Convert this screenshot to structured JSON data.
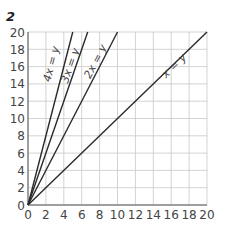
{
  "figure_number": "2",
  "chart_data": {
    "type": "line",
    "title": "",
    "xlabel": "",
    "ylabel": "",
    "xlim": [
      0,
      20
    ],
    "ylim": [
      0,
      20
    ],
    "grid": true,
    "x_ticks": [
      0,
      2,
      4,
      6,
      8,
      10,
      12,
      14,
      16,
      18,
      20
    ],
    "y_ticks": [
      0,
      2,
      4,
      6,
      8,
      10,
      12,
      14,
      16,
      18,
      20
    ],
    "series": [
      {
        "name": "4x = y",
        "slope": 4,
        "x": [
          0,
          5
        ],
        "y": [
          0,
          20
        ]
      },
      {
        "name": "3x = y",
        "slope": 3,
        "x": [
          0,
          6.67
        ],
        "y": [
          0,
          20
        ]
      },
      {
        "name": "2x = y",
        "slope": 2,
        "x": [
          0,
          10
        ],
        "y": [
          0,
          20
        ]
      },
      {
        "name": "x = y",
        "slope": 1,
        "x": [
          0,
          20
        ],
        "y": [
          0,
          20
        ]
      }
    ],
    "colors": {
      "line": "#2a2a2a",
      "grid": "#c8c8c8",
      "axis": "#555555",
      "text": "#444444"
    }
  }
}
